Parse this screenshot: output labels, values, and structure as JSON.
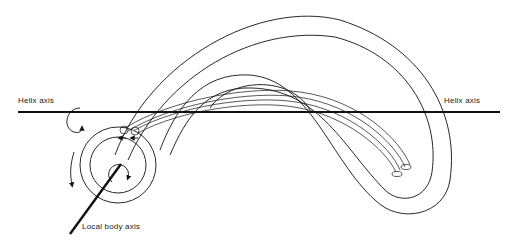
{
  "diagram": {
    "labels": {
      "helix_axis_left": "Helix axis",
      "helix_axis_right": "Helix axis",
      "local_body_axis": "Local body axis"
    },
    "elements": [
      "helix-axis-line",
      "local-body-axis-line",
      "rotation-arrow-around-helix-axis",
      "rotation-arrow-around-body",
      "curved-tubular-body-outer",
      "curved-tubular-body-inner",
      "inner-tube-pair",
      "concentric-cross-section"
    ],
    "colors": {
      "line": "#111111",
      "background": "#ffffff"
    }
  }
}
